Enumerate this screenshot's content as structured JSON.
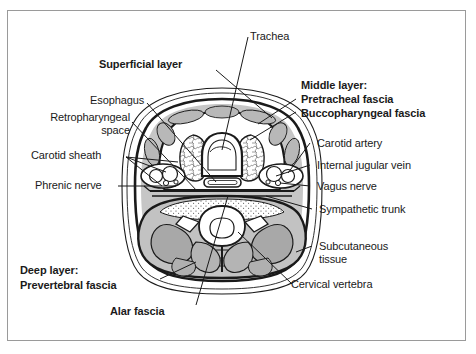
{
  "figure": {
    "type": "anatomical-cross-section",
    "frame_color": "#9a9a9a",
    "background_color": "#ffffff",
    "ink_color": "#1a1a1a",
    "shade_light": "#d6d6d6",
    "shade_mid": "#bdbdbd",
    "shade_dark": "#a6a6a6"
  },
  "labels": {
    "trachea": "Trachea",
    "superficial_layer": "Superficial layer",
    "esophagus": "Esophagus",
    "retropharyngeal_space": "Retropharyngeal\nspace",
    "carotid_sheath": "Carotid sheath",
    "phrenic_nerve": "Phrenic nerve",
    "middle_layer_heading": "Middle layer:",
    "pretracheal_fascia": "Pretracheal fascia",
    "buccopharyngeal_fascia": "Buccopharyngeal fascia",
    "carotid_artery": "Carotid artery",
    "internal_jugular_vein": "Internal jugular vein",
    "vagus_nerve": "Vagus nerve",
    "sympathetic_trunk": "Sympathetic trunk",
    "subcutaneous_tissue": "Subcutaneous\ntissue",
    "cervical_vertebra": "Cervical vertebra",
    "deep_layer_heading": "Deep layer:",
    "prevertebral_fascia": "Prevertebral fascia",
    "alar_fascia": "Alar fascia"
  }
}
